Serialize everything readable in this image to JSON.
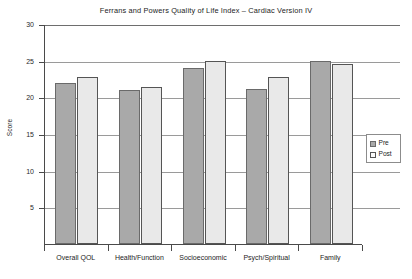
{
  "chart_data": {
    "type": "bar",
    "title": "Ferrans and Powers Quality of Life Index – Cardiac Version IV",
    "xlabel": "",
    "ylabel": "Score",
    "categories": [
      "Overall QOL",
      "Health/Function",
      "Socioeconomic",
      "Psych/Spiritual",
      "Family"
    ],
    "series": [
      {
        "name": "Pre",
        "color": "#a9a9a9",
        "values": [
          22.0,
          21.0,
          24.0,
          21.2,
          25.0
        ]
      },
      {
        "name": "Post",
        "color": "#e9e9e9",
        "values": [
          22.8,
          21.4,
          25.0,
          22.8,
          24.5
        ]
      }
    ],
    "ylim": [
      0,
      30
    ],
    "yticks": [
      0,
      5,
      10,
      15,
      20,
      25,
      30
    ],
    "ytick_labels": [
      "",
      "5",
      "10",
      "15",
      "20",
      "25",
      "30"
    ],
    "grid": true,
    "grid_axis": "y",
    "legend_position": "right"
  },
  "legend": {
    "entries": [
      {
        "label": "Pre"
      },
      {
        "label": "Post"
      }
    ]
  }
}
